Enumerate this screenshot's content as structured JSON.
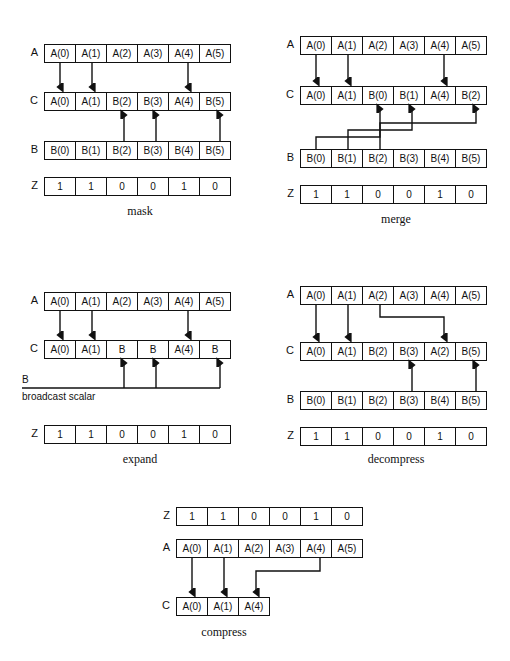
{
  "figure": {
    "mask_vector": [
      "1",
      "1",
      "0",
      "0",
      "1",
      "0"
    ],
    "panels": [
      {
        "id": "mask",
        "caption": "mask",
        "rows": [
          {
            "label": "A",
            "name": "array-a",
            "cells": [
              "A(0)",
              "A(1)",
              "A(2)",
              "A(3)",
              "A(4)",
              "A(5)"
            ]
          },
          {
            "label": "C",
            "name": "array-c",
            "cells": [
              "A(0)",
              "A(1)",
              "B(2)",
              "B(3)",
              "A(4)",
              "B(5)"
            ]
          },
          {
            "label": "B",
            "name": "array-b",
            "cells": [
              "B(0)",
              "B(1)",
              "B(2)",
              "B(3)",
              "B(4)",
              "B(5)"
            ]
          },
          {
            "label": "Z",
            "name": "array-z",
            "cells": [
              "1",
              "1",
              "0",
              "0",
              "1",
              "0"
            ]
          }
        ],
        "a_to_c_direct": [
          0,
          1,
          4
        ],
        "b_to_c_direct": [
          2,
          3,
          5
        ]
      },
      {
        "id": "merge",
        "caption": "merge",
        "rows": [
          {
            "label": "A",
            "name": "array-a",
            "cells": [
              "A(0)",
              "A(1)",
              "A(2)",
              "A(3)",
              "A(4)",
              "A(5)"
            ]
          },
          {
            "label": "C",
            "name": "array-c",
            "cells": [
              "A(0)",
              "A(1)",
              "B(0)",
              "B(1)",
              "A(4)",
              "B(2)"
            ]
          },
          {
            "label": "B",
            "name": "array-b",
            "cells": [
              "B(0)",
              "B(1)",
              "B(2)",
              "B(3)",
              "B(4)",
              "B(5)"
            ]
          },
          {
            "label": "Z",
            "name": "array-z",
            "cells": [
              "1",
              "1",
              "0",
              "0",
              "1",
              "0"
            ]
          }
        ],
        "a_to_c_direct": [
          0,
          1,
          4
        ],
        "b_to_c_routed": [
          {
            "from": 0,
            "to": 2,
            "level": 0
          },
          {
            "from": 1,
            "to": 3,
            "level": 1
          },
          {
            "from": 2,
            "to": 5,
            "level": 2
          }
        ]
      },
      {
        "id": "expand",
        "caption": "expand",
        "rows": [
          {
            "label": "A",
            "name": "array-a",
            "cells": [
              "A(0)",
              "A(1)",
              "A(2)",
              "A(3)",
              "A(4)",
              "A(5)"
            ]
          },
          {
            "label": "C",
            "name": "array-c",
            "cells": [
              "A(0)",
              "A(1)",
              "B",
              "B",
              "A(4)",
              "B"
            ]
          },
          {
            "label": "Z",
            "name": "array-z",
            "cells": [
              "1",
              "1",
              "0",
              "0",
              "1",
              "0"
            ]
          }
        ],
        "a_to_c_direct": [
          0,
          1,
          4
        ],
        "scalar_to_c": [
          2,
          3,
          5
        ],
        "scalar_label": "B",
        "scalar_note": "broadcast scalar"
      },
      {
        "id": "decompress",
        "caption": "decompress",
        "rows": [
          {
            "label": "A",
            "name": "array-a",
            "cells": [
              "A(0)",
              "A(1)",
              "A(2)",
              "A(3)",
              "A(4)",
              "A(5)"
            ]
          },
          {
            "label": "C",
            "name": "array-c",
            "cells": [
              "A(0)",
              "A(1)",
              "B(2)",
              "B(3)",
              "A(2)",
              "B(5)"
            ]
          },
          {
            "label": "B",
            "name": "array-b",
            "cells": [
              "B(0)",
              "B(1)",
              "B(2)",
              "B(3)",
              "B(4)",
              "B(5)"
            ]
          },
          {
            "label": "Z",
            "name": "array-z",
            "cells": [
              "1",
              "1",
              "0",
              "0",
              "1",
              "0"
            ]
          }
        ],
        "a_to_c_direct": [
          0,
          1
        ],
        "a_to_c_routed": [
          {
            "from": 2,
            "to": 4
          }
        ],
        "b_to_c_direct": [
          3,
          5
        ]
      },
      {
        "id": "compress",
        "caption": "compress",
        "rows": [
          {
            "label": "Z",
            "name": "array-z",
            "cells": [
              "1",
              "1",
              "0",
              "0",
              "1",
              "0"
            ]
          },
          {
            "label": "A",
            "name": "array-a",
            "cells": [
              "A(0)",
              "A(1)",
              "A(2)",
              "A(3)",
              "A(4)",
              "A(5)"
            ]
          },
          {
            "label": "C",
            "name": "array-c",
            "cells": [
              "A(0)",
              "A(1)",
              "A(4)"
            ]
          }
        ],
        "a_to_c_direct": [
          {
            "from": 0,
            "to": 0
          },
          {
            "from": 1,
            "to": 1
          }
        ],
        "a_to_c_routed": [
          {
            "from": 4,
            "to": 2
          }
        ]
      }
    ]
  }
}
